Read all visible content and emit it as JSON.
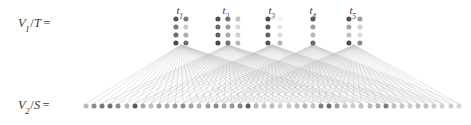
{
  "figure": {
    "width": 471,
    "height": 125,
    "background": "#ffffff"
  },
  "labels": {
    "top_axis": {
      "var": "V",
      "sub": "1",
      "slash": "/",
      "set": "T",
      "eq": "=",
      "full": "V1/T ="
    },
    "bottom_axis": {
      "var": "V",
      "sub": "2",
      "slash": "/",
      "set": "S",
      "eq": "=",
      "full": "V2/S ="
    }
  },
  "chart_data": {
    "type": "diagram",
    "layers": [
      {
        "name": "V1/T",
        "y": 30,
        "description": "five labeled clusters of dots arranged in grids"
      },
      {
        "name": "V2/S",
        "y": 106,
        "description": "single horizontal row of dots"
      }
    ],
    "clusters": [
      {
        "label": "t",
        "sub": "1",
        "label_x": 180,
        "label_y": 4,
        "cols": 2,
        "rows": 4,
        "col_x": [
          176,
          186
        ],
        "row_y": [
          19,
          27,
          35,
          43
        ],
        "dot_radius": 2.6,
        "shades": [
          [
            "#555555",
            "#7a7a7a"
          ],
          [
            "#777777",
            "#c9c9c9"
          ],
          [
            "#6d6d6d",
            "#b0b0b0"
          ],
          [
            "#4a4a4a",
            "#6a6a6a"
          ]
        ],
        "anchor_x": 181,
        "anchor_y": 45
      },
      {
        "label": "t",
        "sub": "2",
        "label_x": 226,
        "label_y": 4,
        "cols": 3,
        "rows": 4,
        "col_x": [
          218,
          228,
          238
        ],
        "row_y": [
          19,
          27,
          35,
          43
        ],
        "dot_radius": 2.6,
        "shades": [
          [
            "#4f4f4f",
            "#6f6f6f",
            "#c2c2c2"
          ],
          [
            "#6a6a6a",
            "#9a9a9a",
            "#d8d8d8"
          ],
          [
            "#5e5e5e",
            "#a8a8a8",
            "#cfcfcf"
          ],
          [
            "#4a4a4a",
            "#707070",
            "#b8b8b8"
          ]
        ],
        "anchor_x": 228,
        "anchor_y": 45
      },
      {
        "label": "t",
        "sub": "3",
        "label_x": 272,
        "label_y": 4,
        "cols": 2,
        "rows": 4,
        "col_x": [
          268,
          280
        ],
        "row_y": [
          19,
          27,
          35,
          43
        ],
        "dot_radius": 2.6,
        "shades": [
          [
            "#4a4a4a",
            "#efefef"
          ],
          [
            "#5a5a5a",
            "#e4e4e4"
          ],
          [
            "#636363",
            "#dcdcdc"
          ],
          [
            "#525252",
            "#b5b5b5"
          ]
        ],
        "anchor_x": 272,
        "anchor_y": 45
      },
      {
        "label": "t",
        "sub": "4",
        "label_x": 313,
        "label_y": 4,
        "cols": 1,
        "rows": 4,
        "col_x": [
          313
        ],
        "row_y": [
          19,
          27,
          35,
          43
        ],
        "dot_radius": 2.6,
        "shades": [
          [
            "#5a5a5a"
          ],
          [
            "#9e9e9e"
          ],
          [
            "#b8b8b8"
          ],
          [
            "#6a6a6a"
          ]
        ],
        "anchor_x": 313,
        "anchor_y": 45
      },
      {
        "label": "t",
        "sub": "5",
        "label_x": 353,
        "label_y": 4,
        "cols": 2,
        "rows": 4,
        "col_x": [
          349,
          360
        ],
        "row_y": [
          19,
          27,
          35,
          43
        ],
        "dot_radius": 2.6,
        "shades": [
          [
            "#4f4f4f",
            "#9c9c9c"
          ],
          [
            "#a5a5a5",
            "#d0d0d0"
          ],
          [
            "#c0c0c0",
            "#dcdcdc"
          ],
          [
            "#4a4a4a",
            "#8a8a8a"
          ]
        ],
        "anchor_x": 354,
        "anchor_y": 45
      }
    ],
    "bottom_row": {
      "y": 106,
      "start_x": 86,
      "spacing": 8.1,
      "count": 47,
      "dot_radius": 2.5,
      "shades": [
        "#b9b9b9",
        "#8a8a8a",
        "#767676",
        "#6e6e6e",
        "#8d8d8d",
        "#b2b2b2",
        "#5a5a5a",
        "#a6a6a6",
        "#bdbdbd",
        "#9f9f9f",
        "#adadad",
        "#9a9a9a",
        "#8e8e8e",
        "#a2a2a2",
        "#b0b0b0",
        "#9d9d9d",
        "#8a8a8a",
        "#a8a8a8",
        "#979797",
        "#848484",
        "#5e5e5e",
        "#b4b4b4",
        "#c4c4c4",
        "#bdbdbd",
        "#cfcfcf",
        "#c8c8c8",
        "#bbbbbb",
        "#b6b6b6",
        "#c2c2c2",
        "#7f7f7f",
        "#6b6b6b",
        "#9a9a9a",
        "#c6c6c6",
        "#cdcdcd",
        "#c0c0c0",
        "#b8b8b8",
        "#ababab",
        "#7c7c7c",
        "#bdbdbd",
        "#c7c7c7",
        "#cacaca",
        "#c2c2c2",
        "#bebebe",
        "#c9c9c9",
        "#d2d2d2",
        "#cdcdcd",
        "#d6d6d6"
      ]
    },
    "edges": {
      "stroke": "#b4b4b4",
      "stroke_width": 0.45,
      "opacity": 0.72,
      "description": "each cluster anchor fans out to a wide contiguous span of bottom-row nodes",
      "spans": [
        {
          "cluster": 0,
          "from": 0,
          "to": 34
        },
        {
          "cluster": 1,
          "from": 2,
          "to": 40
        },
        {
          "cluster": 2,
          "from": 6,
          "to": 44
        },
        {
          "cluster": 3,
          "from": 12,
          "to": 46
        },
        {
          "cluster": 4,
          "from": 16,
          "to": 46
        }
      ]
    },
    "xlabel": "",
    "ylabel": "",
    "grid": false,
    "legend": null
  }
}
